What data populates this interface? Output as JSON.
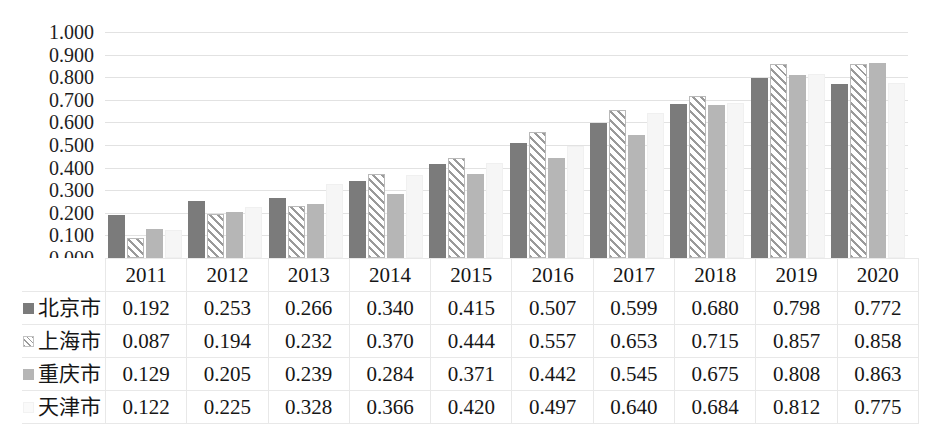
{
  "chart_data": {
    "type": "bar",
    "title": "",
    "xlabel": "",
    "ylabel": "",
    "ylim": [
      0,
      1.0
    ],
    "ytick_step": 0.1,
    "grid": true,
    "legend_position": "table-row-headers",
    "categories": [
      "2011",
      "2012",
      "2013",
      "2014",
      "2015",
      "2016",
      "2017",
      "2018",
      "2019",
      "2020"
    ],
    "ytick_labels": [
      "1.000",
      "0.900",
      "0.800",
      "0.700",
      "0.600",
      "0.500",
      "0.400",
      "0.300",
      "0.200",
      "0.100",
      "0.000"
    ],
    "ytick_values": [
      1.0,
      0.9,
      0.8,
      0.7,
      0.6,
      0.5,
      0.4,
      0.3,
      0.2,
      0.1,
      0.0
    ],
    "series": [
      {
        "name": "北京市",
        "marker": "filled-square-dark",
        "color": "#7b7b7b",
        "values": [
          0.192,
          0.253,
          0.266,
          0.34,
          0.415,
          0.507,
          0.599,
          0.68,
          0.798,
          0.772
        ],
        "labels": [
          "0.192",
          "0.253",
          "0.266",
          "0.340",
          "0.415",
          "0.507",
          "0.599",
          "0.680",
          "0.798",
          "0.772"
        ]
      },
      {
        "name": "上海市",
        "marker": "diagonal-hatch-square",
        "color": "#ffffff",
        "values": [
          0.087,
          0.194,
          0.232,
          0.37,
          0.444,
          0.557,
          0.653,
          0.715,
          0.857,
          0.858
        ],
        "labels": [
          "0.087",
          "0.194",
          "0.232",
          "0.370",
          "0.444",
          "0.557",
          "0.653",
          "0.715",
          "0.857",
          "0.858"
        ]
      },
      {
        "name": "重庆市",
        "marker": "filled-square-light",
        "color": "#b6b6b6",
        "values": [
          0.129,
          0.205,
          0.239,
          0.284,
          0.371,
          0.442,
          0.545,
          0.675,
          0.808,
          0.863
        ],
        "labels": [
          "0.129",
          "0.205",
          "0.239",
          "0.284",
          "0.371",
          "0.442",
          "0.545",
          "0.675",
          "0.808",
          "0.863"
        ]
      },
      {
        "name": "天津市",
        "marker": "filled-square-white",
        "color": "#f6f6f6",
        "values": [
          0.122,
          0.225,
          0.328,
          0.366,
          0.42,
          0.497,
          0.64,
          0.684,
          0.812,
          0.775
        ],
        "labels": [
          "0.122",
          "0.225",
          "0.328",
          "0.366",
          "0.420",
          "0.497",
          "0.640",
          "0.684",
          "0.812",
          "0.775"
        ]
      }
    ]
  },
  "table": {
    "corner_label": "",
    "column_headers": [
      "2011",
      "2012",
      "2013",
      "2014",
      "2015",
      "2016",
      "2017",
      "2018",
      "2019",
      "2020"
    ],
    "rows": [
      {
        "label": "北京市",
        "key": "k0",
        "cells": [
          "0.192",
          "0.253",
          "0.266",
          "0.340",
          "0.415",
          "0.507",
          "0.599",
          "0.680",
          "0.798",
          "0.772"
        ]
      },
      {
        "label": "上海市",
        "key": "k1",
        "cells": [
          "0.087",
          "0.194",
          "0.232",
          "0.370",
          "0.444",
          "0.557",
          "0.653",
          "0.715",
          "0.857",
          "0.858"
        ]
      },
      {
        "label": "重庆市",
        "key": "k2",
        "cells": [
          "0.129",
          "0.205",
          "0.239",
          "0.284",
          "0.371",
          "0.442",
          "0.545",
          "0.675",
          "0.808",
          "0.863"
        ]
      },
      {
        "label": "天津市",
        "key": "k3",
        "cells": [
          "0.122",
          "0.225",
          "0.328",
          "0.366",
          "0.420",
          "0.497",
          "0.640",
          "0.684",
          "0.812",
          "0.775"
        ]
      }
    ]
  },
  "colors": {
    "series_1": "#7b7b7b",
    "series_2": "#ffffff",
    "series_3": "#b6b6b6",
    "series_4": "#f6f6f6",
    "gridline": "#e2e2e2",
    "table_border": "#e8e8e8",
    "text": "#1a1a1a"
  }
}
